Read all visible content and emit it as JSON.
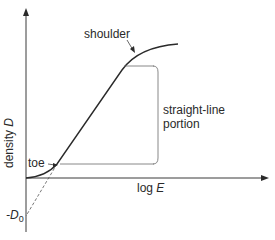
{
  "diagram": {
    "y_axis_label": "density",
    "y_axis_symbol": "D",
    "x_axis_label": "log",
    "x_axis_symbol": "E",
    "intercept_label_prefix": "-D",
    "intercept_label_subscript": "0",
    "annotations": {
      "shoulder": "shoulder",
      "toe": "toe",
      "straight_line_1": "straight-line",
      "straight_line_2": "portion"
    },
    "colors": {
      "line": "#2a2a2a",
      "guide": "#6a6a6a",
      "background": "#ffffff"
    }
  }
}
